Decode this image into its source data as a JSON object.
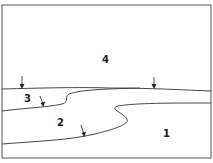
{
  "diagram": {
    "type": "geologic-cross-section",
    "units": [
      {
        "id": "unit-1",
        "label": "1"
      },
      {
        "id": "unit-2",
        "label": "2"
      },
      {
        "id": "unit-3",
        "label": "3"
      },
      {
        "id": "unit-4",
        "label": "4"
      }
    ],
    "arrows": [
      {
        "id": "arrow-top-left",
        "points_to": "boundary between 4 and 3"
      },
      {
        "id": "arrow-top-right",
        "points_to": "boundary between 4 and 1"
      },
      {
        "id": "arrow-unit-3",
        "points_to": "boundary between 3 and 2"
      },
      {
        "id": "arrow-unit-2",
        "points_to": "boundary between 2 and 1"
      }
    ],
    "colors": {
      "line": "#333333",
      "background": "#ffffff"
    }
  }
}
